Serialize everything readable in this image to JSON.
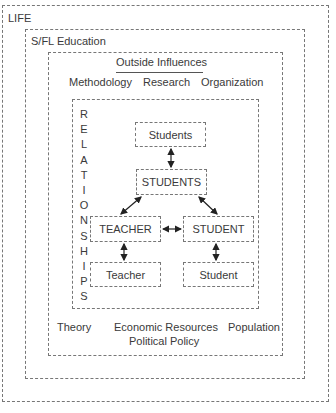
{
  "diagram": {
    "outer": {
      "label": "LIFE"
    },
    "education": {
      "label": "S/FL Education"
    },
    "outside": {
      "title": "Outside Influences",
      "top_items": [
        "Methodology",
        "Research",
        "Organization"
      ],
      "bottom_items": [
        "Theory",
        "Economic Resources",
        "Population"
      ],
      "bottom_center": "Political Policy"
    },
    "relationships": {
      "label_letters": [
        "R",
        "E",
        "L",
        "A",
        "T",
        "I",
        "O",
        "N",
        "S",
        "H",
        "I",
        "P",
        "S"
      ],
      "label": "RELATIONSHIPS",
      "nodes": {
        "students_small": "Students",
        "students_caps": "STUDENTS",
        "teacher_caps": "TEACHER",
        "student_caps": "STUDENT",
        "teacher_small": "Teacher",
        "student_small": "Student"
      },
      "edges": [
        [
          "students_small",
          "students_caps"
        ],
        [
          "students_caps",
          "teacher_caps"
        ],
        [
          "students_caps",
          "student_caps"
        ],
        [
          "teacher_caps",
          "student_caps"
        ],
        [
          "teacher_caps",
          "teacher_small"
        ],
        [
          "student_caps",
          "student_small"
        ]
      ]
    }
  }
}
